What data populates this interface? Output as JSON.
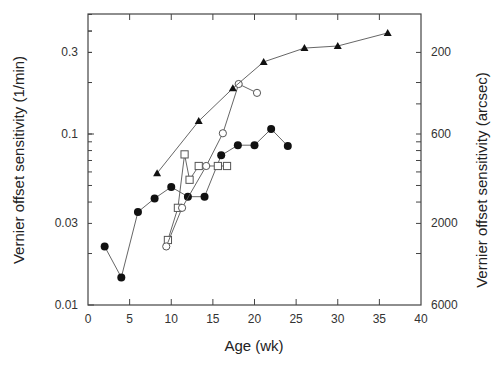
{
  "chart_data": {
    "type": "line",
    "title": "",
    "xlabel": "Age (wk)",
    "ylabel": "Vernier offset sensitivity (1/min)",
    "ylabel_right": "Vernier offset sensitivity (arcsec)",
    "xlim": [
      0,
      40
    ],
    "ylim": [
      0.01,
      0.5
    ],
    "yscale": "log",
    "grid": false,
    "legend": "none",
    "x_ticks": [
      0,
      5,
      10,
      15,
      20,
      25,
      30,
      35,
      40
    ],
    "y_ticks_left": [
      0.01,
      0.03,
      0.1,
      0.3
    ],
    "y_ticks_left_labels": [
      "0.01",
      "0.03",
      "0.1",
      "0.3"
    ],
    "y_ticks_right_labels": [
      "200",
      "600",
      "2000",
      "6000"
    ],
    "y_ticks_right_positions": [
      0.3,
      0.1,
      0.03,
      0.01
    ],
    "series": [
      {
        "name": "filled-circles",
        "marker": "circle-filled",
        "x": [
          2,
          4,
          6,
          8,
          10,
          12,
          14,
          16,
          18,
          20,
          22,
          24
        ],
        "y": [
          0.022,
          0.0145,
          0.035,
          0.042,
          0.049,
          0.043,
          0.043,
          0.075,
          0.086,
          0.086,
          0.107,
          0.085
        ]
      },
      {
        "name": "open-squares",
        "marker": "square-open",
        "x": [
          9.6,
          10.8,
          11.6,
          12.2,
          13.3,
          15.6,
          16.7
        ],
        "y": [
          0.024,
          0.037,
          0.076,
          0.054,
          0.065,
          0.065,
          0.065
        ]
      },
      {
        "name": "open-circles",
        "marker": "circle-open",
        "x": [
          9.4,
          11.3,
          14.2,
          16.2,
          18.1,
          20.3
        ],
        "y": [
          0.022,
          0.037,
          0.065,
          0.101,
          0.196,
          0.174
        ]
      },
      {
        "name": "filled-triangles",
        "marker": "triangle-filled",
        "x": [
          8.3,
          13.3,
          17.4,
          21.1,
          26,
          30,
          36
        ],
        "y": [
          0.059,
          0.119,
          0.185,
          0.264,
          0.318,
          0.327,
          0.39
        ]
      }
    ]
  },
  "caption_fragment": ""
}
